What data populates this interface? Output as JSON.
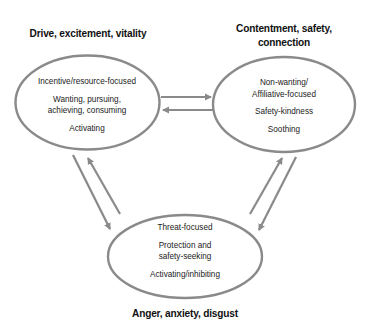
{
  "diagram": {
    "type": "three-circles-model",
    "colors": {
      "stroke": "#8a8a8a",
      "heading_text": "#111111",
      "body_text": "#222222",
      "background": "#ffffff"
    },
    "nodes": {
      "drive": {
        "heading": "Drive, excitement, vitality",
        "groups": [
          {
            "lines": [
              "Incentive/resource-focused"
            ]
          },
          {
            "lines": [
              "Wanting, pursuing,",
              "achieving, consuming"
            ]
          },
          {
            "lines": [
              "Activating"
            ]
          }
        ]
      },
      "soothing": {
        "heading_lines": [
          "Contentment, safety,",
          "connection"
        ],
        "groups": [
          {
            "lines": [
              "Non-wanting/",
              "Affiliative-focused"
            ]
          },
          {
            "lines": [
              "Safety-kindness"
            ]
          },
          {
            "lines": [
              "Soothing"
            ]
          }
        ]
      },
      "threat": {
        "heading": "Anger, anxiety, disgust",
        "groups": [
          {
            "lines": [
              "Threat-focused"
            ]
          },
          {
            "lines": [
              "Protection and",
              "safety-seeking"
            ]
          },
          {
            "lines": [
              "Activating/inhibiting"
            ]
          }
        ]
      }
    },
    "edges": [
      {
        "from": "drive",
        "to": "soothing",
        "direction": "right"
      },
      {
        "from": "soothing",
        "to": "drive",
        "direction": "left"
      },
      {
        "from": "drive",
        "to": "threat",
        "direction": "down"
      },
      {
        "from": "threat",
        "to": "drive",
        "direction": "up"
      },
      {
        "from": "threat",
        "to": "soothing",
        "direction": "up"
      },
      {
        "from": "soothing",
        "to": "threat",
        "direction": "down"
      }
    ]
  }
}
